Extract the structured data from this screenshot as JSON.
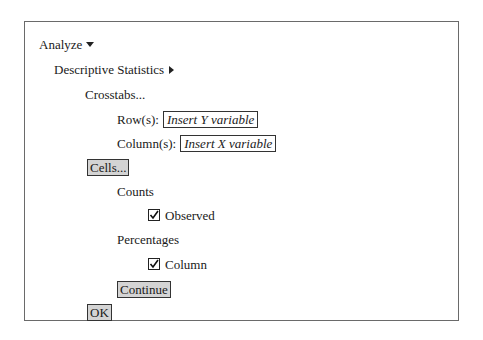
{
  "menu": {
    "analyze_label": "Analyze",
    "descriptive_label": "Descriptive Statistics",
    "crosstabs_label": "Crosstabs..."
  },
  "crosstabs": {
    "row_label": "Row(s):",
    "row_value": "Insert Y variable",
    "column_label": "Column(s):",
    "column_value": "Insert X variable",
    "cells_button": "Cells...",
    "ok_button": "OK"
  },
  "cells": {
    "counts_label": "Counts",
    "observed_label": "Observed",
    "observed_checked": true,
    "percentages_label": "Percentages",
    "column_label": "Column",
    "column_checked": true,
    "continue_button": "Continue"
  }
}
